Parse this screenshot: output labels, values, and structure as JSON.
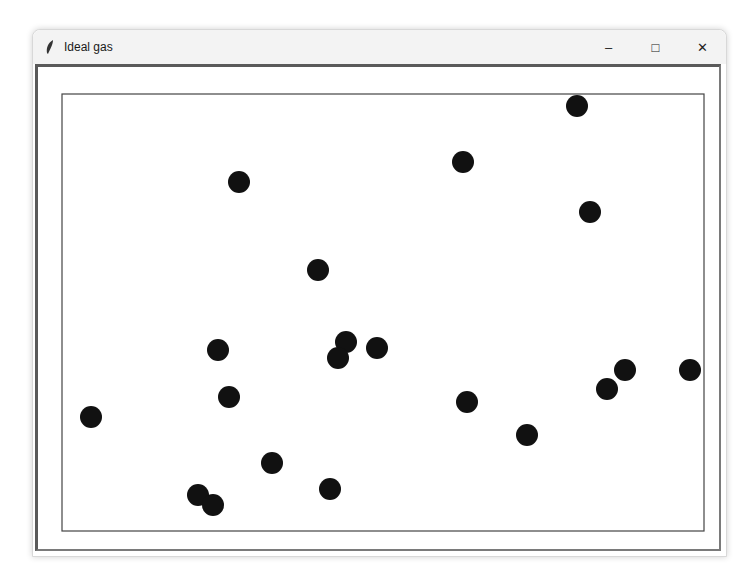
{
  "window": {
    "title": "Ideal gas",
    "icon": "feather-icon",
    "controls": {
      "minimize": "–",
      "maximize": "□",
      "close": "✕"
    }
  },
  "simulation": {
    "container": {
      "x1": 62,
      "y1": 94,
      "x2": 704,
      "y2": 531,
      "stroke": "#444444"
    },
    "particle_color": "#111111",
    "particle_radius": 11,
    "particles": [
      {
        "x": 577,
        "y": 106
      },
      {
        "x": 463,
        "y": 162
      },
      {
        "x": 239,
        "y": 182
      },
      {
        "x": 590,
        "y": 212
      },
      {
        "x": 318,
        "y": 270
      },
      {
        "x": 346,
        "y": 342
      },
      {
        "x": 338,
        "y": 358
      },
      {
        "x": 377,
        "y": 348
      },
      {
        "x": 218,
        "y": 350
      },
      {
        "x": 229,
        "y": 397
      },
      {
        "x": 91,
        "y": 417
      },
      {
        "x": 467,
        "y": 402
      },
      {
        "x": 625,
        "y": 370
      },
      {
        "x": 607,
        "y": 389
      },
      {
        "x": 690,
        "y": 370
      },
      {
        "x": 527,
        "y": 435
      },
      {
        "x": 272,
        "y": 463
      },
      {
        "x": 330,
        "y": 489
      },
      {
        "x": 198,
        "y": 495
      },
      {
        "x": 213,
        "y": 505
      }
    ]
  }
}
